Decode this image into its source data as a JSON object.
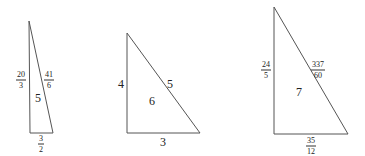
{
  "triangles": [
    {
      "id": "t1",
      "vertices": [
        [
          29,
          21
        ],
        [
          30,
          133
        ],
        [
          53,
          133
        ]
      ],
      "legs": {
        "vertical": {
          "num": "20",
          "den": "3"
        },
        "hypotenuse": {
          "num": "41",
          "den": "6"
        },
        "base": {
          "num": "3",
          "den": "2"
        }
      },
      "area": "5"
    },
    {
      "id": "t2",
      "vertices": [
        [
          127,
          33
        ],
        [
          127,
          133
        ],
        [
          200,
          133
        ]
      ],
      "legs": {
        "vertical": "4",
        "hypotenuse": "5",
        "base": "3"
      },
      "area": "6"
    },
    {
      "id": "t3",
      "vertices": [
        [
          274,
          7
        ],
        [
          274,
          134
        ],
        [
          348,
          134
        ]
      ],
      "legs": {
        "vertical": {
          "num": "24",
          "den": "5"
        },
        "hypotenuse": {
          "num": "337",
          "den": "60"
        },
        "base": {
          "num": "35",
          "den": "12"
        }
      },
      "area": "7"
    }
  ],
  "colors": {
    "stroke": "#555555",
    "text": "#222222",
    "background": "#ffffff"
  }
}
